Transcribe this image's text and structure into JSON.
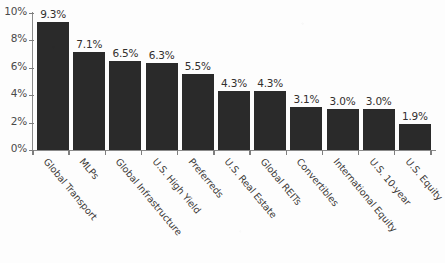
{
  "chart_data": {
    "type": "bar",
    "title": "",
    "subtitle": "",
    "xlabel": "",
    "ylabel": "",
    "ylim": [
      0,
      10
    ],
    "grid": false,
    "legend": false,
    "y_tick_labels": [
      "10%",
      "8%",
      "6%",
      "4%",
      "2%",
      "0%"
    ],
    "y_ticks": [
      10,
      8,
      6,
      4,
      2,
      0
    ],
    "categories": [
      "Global Transport",
      "MLPs",
      "Global Infrastructure",
      "U.S. High Yield",
      "Preferreds",
      "U.S. Real Estate",
      "Global REITs",
      "Convertibles",
      "International Equity",
      "U.S. 10-year",
      "U.S. Equity"
    ],
    "values": [
      9.3,
      7.1,
      6.5,
      6.3,
      5.5,
      4.3,
      4.3,
      3.1,
      3.0,
      3.0,
      1.9
    ],
    "value_labels": [
      "9.3%",
      "7.1%",
      "6.5%",
      "6.3%",
      "5.5%",
      "4.3%",
      "4.3%",
      "3.1%",
      "3.0%",
      "3.0%",
      "1.9%"
    ],
    "bar_color": "#2a2a2a",
    "axis_color": "#8a8a8a",
    "text_color": "#3c3937",
    "background_color": "#fdfdfd"
  }
}
